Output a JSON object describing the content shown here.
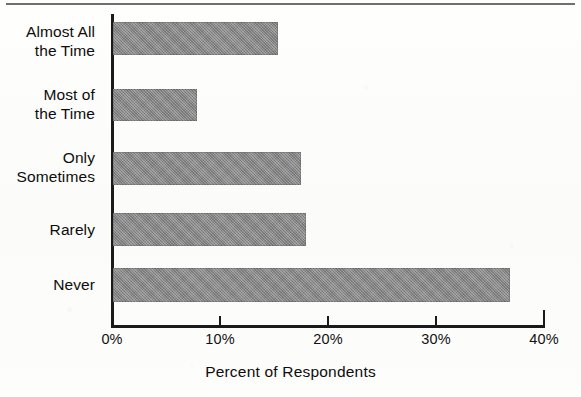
{
  "figure": {
    "background_color": "#fdfdfb",
    "bar_color": "#8d8d8d",
    "axis_color": "#1a1a1a"
  },
  "chart_data": {
    "type": "bar",
    "orientation": "horizontal",
    "title": "",
    "subtitle": "",
    "xlabel": "Percent of Respondents",
    "ylabel": "",
    "categories": [
      "Almost All\nthe Time",
      "Most of\nthe Time",
      "Only\nSometimes",
      "Rarely",
      "Never"
    ],
    "values": [
      15.3,
      7.8,
      17.4,
      17.9,
      36.8
    ],
    "value_labels": [
      "",
      "",
      "",
      "",
      ""
    ],
    "xlim": [
      0,
      40
    ],
    "xticks": [
      0,
      10,
      20,
      30,
      40
    ],
    "xtick_labels": [
      "0%",
      "10%",
      "20%",
      "30%",
      "40%"
    ],
    "grid": false,
    "legend": null,
    "annotations": []
  }
}
